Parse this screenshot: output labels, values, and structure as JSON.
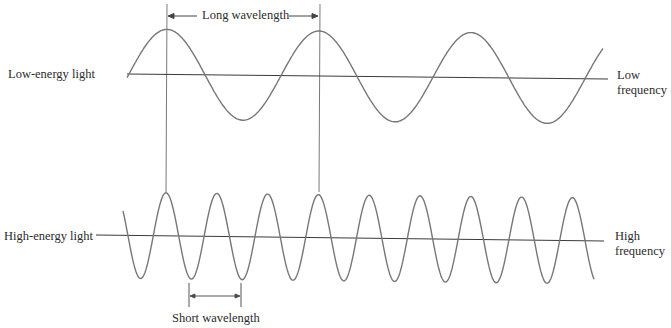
{
  "diagram": {
    "type": "wave-comparison",
    "low_wave": {
      "label": "Low-energy light",
      "frequency_label_line1": "Low",
      "frequency_label_line2": "frequency",
      "wavelength_label": "Long wavelength",
      "axis": {
        "x1": 127,
        "y1": 74,
        "x2": 608,
        "y2": 79
      },
      "start_x": 127,
      "end_x": 603,
      "first_peak_x": 167,
      "period_px": 152,
      "amplitude_px": 45
    },
    "high_wave": {
      "label": "High-energy light",
      "frequency_label_line1": "High",
      "frequency_label_line2": "frequency",
      "wavelength_label": "Short wavelength",
      "axis": {
        "x1": 96,
        "y1": 235,
        "x2": 604,
        "y2": 241
      },
      "start_x": 123,
      "end_x": 594,
      "first_peak_x": 166,
      "period_px": 50.8,
      "amplitude_px": 43
    },
    "guide_lines_x": [
      167,
      319
    ],
    "colors": {
      "line": "#6e6e6e",
      "axis": "#3a3a3a",
      "text": "#2b2b2b"
    }
  }
}
